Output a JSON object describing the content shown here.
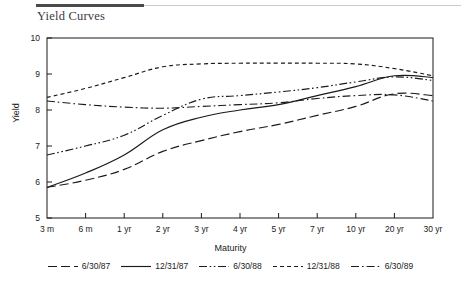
{
  "header": {
    "title": "Yield Curves",
    "rule_dark_color": "#4a4a4a",
    "rule_light_color": "#c9c9c9"
  },
  "chart_data": {
    "type": "line",
    "title": "Yield Curves",
    "xlabel": "Maturity",
    "ylabel": "Yield",
    "ylim": [
      5,
      10
    ],
    "yticks": [
      5,
      6,
      7,
      8,
      9,
      10
    ],
    "grid": false,
    "legend_position": "bottom",
    "line_color": "#1a1a1a",
    "categories": [
      "3 m",
      "6 m",
      "1 yr",
      "2 yr",
      "3 yr",
      "4 yr",
      "5 yr",
      "7 yr",
      "10 yr",
      "20 yr",
      "30 yr"
    ],
    "series": [
      {
        "name": "6/30/87",
        "dash": "long-dash",
        "values": [
          5.85,
          6.05,
          6.35,
          6.85,
          7.15,
          7.4,
          7.6,
          7.85,
          8.1,
          8.45,
          8.4
        ]
      },
      {
        "name": "12/31/87",
        "dash": "solid",
        "values": [
          5.85,
          6.25,
          6.75,
          7.45,
          7.8,
          8.0,
          8.15,
          8.4,
          8.65,
          8.95,
          8.9
        ]
      },
      {
        "name": "6/30/88",
        "dash": "dash-dot-dot",
        "values": [
          6.75,
          7.0,
          7.3,
          7.85,
          8.3,
          8.4,
          8.5,
          8.62,
          8.78,
          8.92,
          8.82
        ]
      },
      {
        "name": "12/31/88",
        "dash": "short-dash",
        "values": [
          8.35,
          8.6,
          8.9,
          9.2,
          9.28,
          9.3,
          9.3,
          9.3,
          9.28,
          9.15,
          8.95
        ]
      },
      {
        "name": "6/30/89",
        "dash": "dash-dot",
        "values": [
          8.25,
          8.15,
          8.08,
          8.05,
          8.1,
          8.15,
          8.2,
          8.32,
          8.4,
          8.42,
          8.25
        ]
      }
    ]
  }
}
